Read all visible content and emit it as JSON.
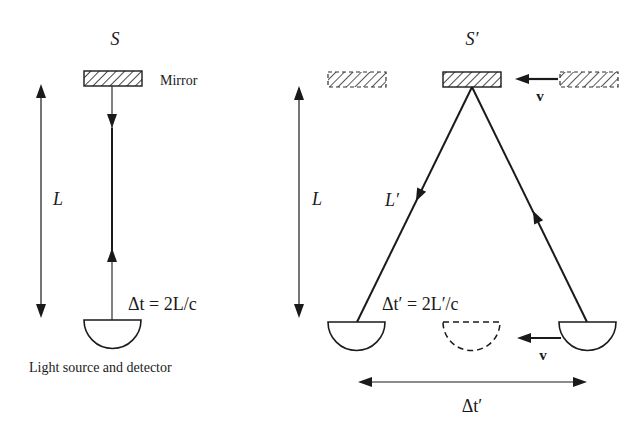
{
  "diagram": {
    "colors": {
      "ink": "#1a1a1a",
      "background": "#ffffff"
    },
    "left_panel": {
      "frame_label": "S",
      "mirror_label": "Mirror",
      "length_label": "L",
      "equation": "Δt = 2L/c",
      "source_label": "Light source and detector"
    },
    "right_panel": {
      "frame_label": "S′",
      "length_label": "L",
      "path_label": "L′",
      "equation": "Δt′ = 2L′/c",
      "velocity_label_top": "v",
      "velocity_label_bottom": "v",
      "interval_label": "Δt′"
    }
  }
}
